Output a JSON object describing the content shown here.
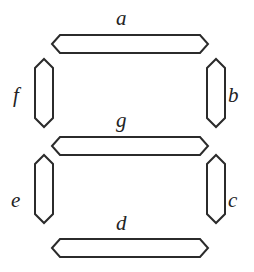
{
  "figure": {
    "name": "seven-segment-display-diagram",
    "background_color": "#ffffff",
    "stroke_color": "#2b2b2b",
    "fill_color": "#ffffff",
    "stroke_width": 2,
    "width": 254,
    "height": 272
  },
  "segments": [
    {
      "id": "a",
      "label": "a",
      "orientation": "horizontal",
      "position": "top",
      "label_x": 116,
      "label_y": 8,
      "points": "52,44 60,35 200,35 208,44 200,53 60,53"
    },
    {
      "id": "b",
      "label": "b",
      "orientation": "vertical",
      "position": "upper-right",
      "label_x": 228,
      "label_y": 85,
      "points": "207,68 216,59 225,68 225,118 216,127 207,118"
    },
    {
      "id": "c",
      "label": "c",
      "orientation": "vertical",
      "position": "lower-right",
      "label_x": 228,
      "label_y": 190,
      "points": "207,164 216,155 225,164 225,214 216,223 207,214"
    },
    {
      "id": "d",
      "label": "d",
      "orientation": "horizontal",
      "position": "bottom",
      "label_x": 116,
      "label_y": 213,
      "points": "52,248 60,239 200,239 208,248 200,257 60,257"
    },
    {
      "id": "e",
      "label": "e",
      "orientation": "vertical",
      "position": "lower-left",
      "label_x": 11,
      "label_y": 190,
      "points": "35,164 44,155 53,164 53,214 44,223 35,214"
    },
    {
      "id": "f",
      "label": "f",
      "orientation": "vertical",
      "position": "upper-left",
      "label_x": 13,
      "label_y": 85,
      "points": "35,68 44,59 53,68 53,118 44,127 35,118"
    },
    {
      "id": "g",
      "label": "g",
      "orientation": "horizontal",
      "position": "middle",
      "label_x": 116,
      "label_y": 110,
      "points": "52,146 60,137 200,137 208,146 200,155 60,155"
    }
  ]
}
